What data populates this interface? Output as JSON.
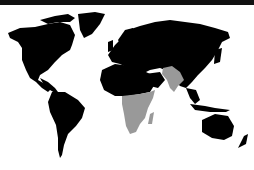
{
  "map": {
    "type": "world-choropleth",
    "caption": "World map highlighting Sub-Saharan Africa and South Asia",
    "colors": {
      "background": "#ffffff",
      "topbar": "#111111",
      "land": "#000000",
      "highlight": "#999999"
    },
    "highlighted_regions": [
      "Sub-Saharan Africa",
      "South Asia",
      "Madagascar"
    ],
    "base_regions": [
      "North America",
      "Greenland",
      "South America",
      "Europe",
      "North Africa",
      "Middle East",
      "Russia",
      "East Asia",
      "Southeast Asia",
      "Australia",
      "New Zealand"
    ]
  }
}
